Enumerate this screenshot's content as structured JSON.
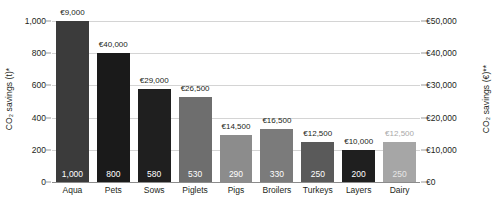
{
  "chart_data": {
    "type": "bar",
    "title": "",
    "subtitle": "",
    "xlabel": "",
    "ylabel": "CO₂ savings (t)*",
    "y2label": "CO₂ savings (€)**",
    "grid": true,
    "legend": "none",
    "categories": [
      "Aqua",
      "Pets",
      "Sows",
      "Piglets",
      "Pigs",
      "Broilers",
      "Turkeys",
      "Layers",
      "Dairy"
    ],
    "values": [
      1000,
      800,
      580,
      530,
      290,
      330,
      250,
      200,
      250
    ],
    "value_labels": [
      "1,000",
      "800",
      "580",
      "530",
      "290",
      "330",
      "250",
      "200",
      "250"
    ],
    "money_labels": [
      "€9,000",
      "€40,000",
      "€29,000",
      "€26,500",
      "€14,500",
      "€16,500",
      "€12,500",
      "€10,000",
      "€12,500"
    ],
    "money_values": [
      9000,
      40000,
      29000,
      26500,
      14500,
      16500,
      12500,
      10000,
      12500
    ],
    "bar_colors": [
      "#3b3b3b",
      "#1a1a1a",
      "#1f1f1f",
      "#6e6e6e",
      "#8c8c8c",
      "#7b7b7b",
      "#5a5a5a",
      "#1f1f1f",
      "#a6a6a6"
    ],
    "ylim": [
      0,
      1000
    ],
    "y2lim": [
      0,
      50000
    ],
    "yticks": [
      0,
      200,
      400,
      600,
      800,
      1000
    ],
    "ytick_labels": [
      "0",
      "200",
      "400",
      "600",
      "800",
      "1,000"
    ],
    "y2ticks": [
      0,
      10000,
      20000,
      30000,
      40000,
      50000
    ],
    "y2tick_labels": [
      "€0",
      "€10,000",
      "€20,000",
      "€30,000",
      "€40,000",
      "€50,000"
    ],
    "colors": {
      "gridline": "#d4d4d4",
      "baseline": "#8c8c8c",
      "text": "#231f20",
      "dim_text": "#a9a9a9"
    }
  }
}
